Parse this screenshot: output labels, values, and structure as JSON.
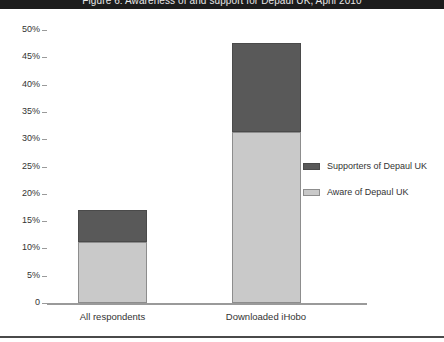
{
  "header": {
    "title": "Figure 6: Awareness of and support for Depaul UK, April 2010"
  },
  "chart_data": {
    "type": "bar",
    "stacked": true,
    "title": "Figure 6: Awareness of and support for Depaul UK, April 2010",
    "xlabel": "",
    "ylabel": "",
    "categories": [
      "All respondents",
      "Downloaded iHobo"
    ],
    "series": [
      {
        "name": "Supporters of Depaul UK",
        "values": [
          5.8,
          16.2
        ],
        "color": "#595959"
      },
      {
        "name": "Aware of Depaul UK",
        "values": [
          11.2,
          31.4
        ],
        "color": "#c9c9c9"
      }
    ],
    "totals": [
      17.0,
      47.6
    ],
    "ylim": [
      0,
      50
    ],
    "ytick_labels": [
      "50%",
      "45%",
      "40%",
      "35%",
      "30%",
      "25%",
      "20%",
      "15%",
      "10%",
      "5%",
      "0"
    ],
    "ytick_values": [
      50,
      45,
      40,
      35,
      30,
      25,
      20,
      15,
      10,
      5,
      0
    ],
    "grid": false,
    "legend_position": "right"
  },
  "legend": {
    "items": [
      {
        "label": "Supporters of Depaul UK",
        "color": "#595959"
      },
      {
        "label": "Aware of Depaul UK",
        "color": "#c9c9c9"
      }
    ]
  },
  "colors": {
    "supporters": "#595959",
    "aware": "#c9c9c9",
    "axis": "#9a9a9a",
    "text": "#333333",
    "header_bg": "#1c1c1c"
  }
}
